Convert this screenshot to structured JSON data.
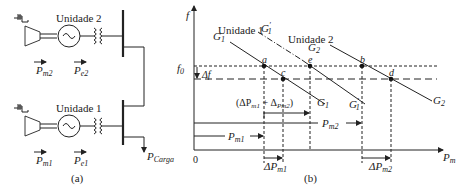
{
  "panel_a": {
    "caption": "(a)",
    "unit2": {
      "label": "Unidade 2",
      "pm": "P",
      "pm_sub": "m2",
      "pe": "P",
      "pe_sub": "e2"
    },
    "unit1": {
      "label": "Unidade 1",
      "pm": "P",
      "pm_sub": "m1",
      "pe": "P",
      "pe_sub": "e1"
    },
    "load": {
      "label": "P",
      "sub": "Carga"
    }
  },
  "panel_b": {
    "caption": "(b)",
    "y_axis": "f",
    "x_axis": "P",
    "x_axis_sub": "m",
    "origin": "0",
    "f0": "f",
    "f0_sub": "0",
    "delta_f": "Δf",
    "unit1_label": "Unidade 1",
    "unit2_label": "Unidade 2",
    "curves": {
      "G1": {
        "main": "G",
        "sub": "1"
      },
      "G1p": {
        "main": "G",
        "sub": "1",
        "prime": "′"
      },
      "G2": {
        "main": "G",
        "sub": "2"
      }
    },
    "points": {
      "a": "a",
      "b": "b",
      "c": "c",
      "d": "d",
      "e": "e"
    },
    "sum_label": "(ΔP",
    "sum_sub1": "m1",
    "sum_plus": " + Δ",
    "sum_sub2": "Pm2",
    "sum_close": ")",
    "pm1": {
      "main": "P",
      "sub": "m1"
    },
    "pm2": {
      "main": "P",
      "sub": "m2"
    },
    "dpm1": {
      "main": "ΔP",
      "sub": "m1"
    },
    "dpm2": {
      "main": "ΔP",
      "sub": "m2"
    }
  }
}
